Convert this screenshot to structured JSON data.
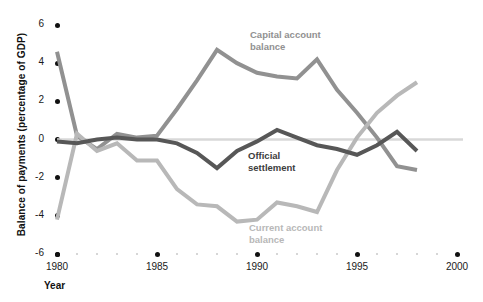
{
  "chart_data": {
    "type": "line",
    "title": "",
    "subtitle": "",
    "xlabel": "Year",
    "ylabel": "Balance of payments (percentage of GDP)",
    "xlim": [
      1980,
      2000
    ],
    "ylim": [
      -6,
      6
    ],
    "xticks": [
      1980,
      1985,
      1990,
      1995,
      2000
    ],
    "yticks": [
      6,
      4,
      2,
      0,
      -2,
      -4,
      -6
    ],
    "xtick_labels": [
      "1980",
      "1985",
      "1990",
      "1995",
      "2000"
    ],
    "ytick_labels": [
      "6",
      "4",
      "2",
      "0",
      "-2",
      "-4",
      "-6"
    ],
    "grid": false,
    "zero_line": true,
    "legend_position": "inline-annotations",
    "x": [
      1980,
      1981,
      1982,
      1983,
      1984,
      1985,
      1986,
      1987,
      1988,
      1989,
      1990,
      1991,
      1992,
      1993,
      1994,
      1995,
      1996,
      1997,
      1998
    ],
    "series": [
      {
        "name": "Capital account balance",
        "color": "#919191",
        "values": [
          4.6,
          0.2,
          -0.5,
          0.3,
          0.1,
          0.2,
          1.6,
          3.1,
          4.7,
          4.0,
          3.5,
          3.3,
          3.2,
          4.2,
          2.6,
          1.4,
          0.1,
          -1.4,
          -1.6
        ]
      },
      {
        "name": "Current account balance",
        "color": "#b8b8b8",
        "values": [
          -4.2,
          0.3,
          -0.6,
          -0.2,
          -1.1,
          -1.1,
          -2.6,
          -3.4,
          -3.5,
          -4.3,
          -4.2,
          -3.3,
          -3.5,
          -3.8,
          -1.6,
          0.1,
          1.4,
          2.3,
          3.0
        ]
      },
      {
        "name": "Official settlement",
        "color": "#575757",
        "values": [
          -0.1,
          -0.2,
          0.0,
          0.1,
          0.0,
          0.0,
          -0.2,
          -0.7,
          -1.5,
          -0.6,
          -0.1,
          0.5,
          0.1,
          -0.3,
          -0.5,
          -0.8,
          -0.3,
          0.4,
          -0.6
        ]
      }
    ],
    "annotations": [
      {
        "name": "capital-account-balance-label",
        "text": "Capital account\nbalance",
        "color": "#919191",
        "x": 250,
        "y": 29
      },
      {
        "name": "official-settlement-label",
        "text": "Official\nsettlement",
        "color": "#3d3d3d",
        "x": 248,
        "y": 150
      },
      {
        "name": "current-account-balance-label",
        "text": "Current account\nbalance",
        "color": "#b8b8b8",
        "x": 249,
        "y": 222
      }
    ],
    "colors": {
      "capital": "#919191",
      "current": "#b8b8b8",
      "official": "#575757",
      "zero_line": "#d8d8d8",
      "tick_dot": "#111111",
      "minor_tick_dot": "#c9c9c9"
    }
  }
}
